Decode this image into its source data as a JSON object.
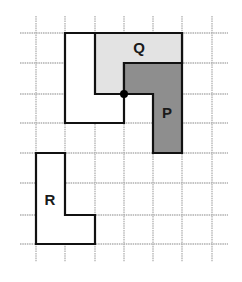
{
  "diagram": {
    "type": "grid-shapes",
    "grid": {
      "x_lines": [
        36,
        65,
        95,
        124,
        153,
        182,
        212
      ],
      "y_lines": [
        33,
        63,
        94,
        123,
        153,
        183,
        215,
        244
      ],
      "x_extent": [
        20,
        228
      ],
      "y_extent": [
        16,
        262
      ],
      "line_color": "#b0b0b0"
    },
    "shapes": [
      {
        "name": "outline",
        "label": "",
        "points": "65,33 182,33 182,63 124,63 124,123 65,123",
        "fill": "#ffffff"
      },
      {
        "name": "Q",
        "label": "Q",
        "points": "95,33 182,33 182,63 124,63 124,94 95,94",
        "fill": "#e3e3e3",
        "label_pos": [
          139,
          53
        ]
      },
      {
        "name": "P",
        "label": "P",
        "points": "124,63 182,63 182,153 153,153 153,94 124,94",
        "fill": "#8e8e8e",
        "label_pos": [
          167,
          118
        ]
      },
      {
        "name": "R",
        "label": "R",
        "points": "36,153 65,153 65,215 95,215 95,244 36,244",
        "fill": "#ffffff",
        "label_pos": [
          50,
          205
        ]
      }
    ],
    "point": {
      "name": "rotation-center",
      "x": 124,
      "y": 94,
      "r": 4
    },
    "labels": {
      "q": "Q",
      "p": "P",
      "r": "R"
    }
  }
}
